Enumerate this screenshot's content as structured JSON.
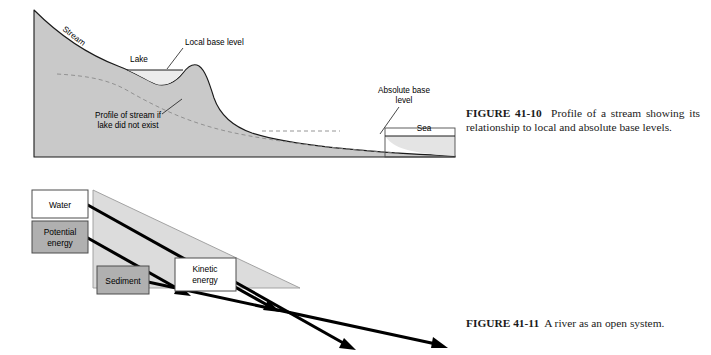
{
  "page": {
    "background": "#ffffff",
    "width": 711,
    "height": 355
  },
  "figures": [
    {
      "id": "figure-41-10",
      "number": "41-10",
      "caption_label": "FIGURE 41-10",
      "caption_text": "Profile of a stream showing its relationship to local and absolute base levels.",
      "labels": {
        "stream": "Stream",
        "lake": "Lake",
        "local_base_level": "Local base level",
        "absolute_base_level_line1": "Absolute base",
        "absolute_base_level_line2": "level",
        "sea": "Sea",
        "dashed_profile_line1": "Profile of stream if",
        "dashed_profile_line2": "lake did not exist"
      },
      "colors": {
        "land_fill": "#c9c9c9",
        "water_fill": "#e4e4e4",
        "outline": "#1a1a1a",
        "dashed_line": "#8a8a8a"
      }
    },
    {
      "id": "figure-41-11",
      "number": "41-11",
      "caption_label": "FIGURE 41-11",
      "caption_text": "A river as an open system.",
      "boxes": [
        {
          "name": "water",
          "label": "Water",
          "fill": "#ffffff",
          "lines": [
            "Water"
          ]
        },
        {
          "name": "potential-energy",
          "label": "Potential energy",
          "fill": "#b0b0b0",
          "lines": [
            "Potential",
            "energy"
          ]
        },
        {
          "name": "sediment",
          "label": "Sediment",
          "fill": "#b0b0b0",
          "lines": [
            "Sediment"
          ]
        },
        {
          "name": "kinetic-energy",
          "label": "Kinetic energy",
          "fill": "#ffffff",
          "lines": [
            "Kinetic",
            "energy"
          ]
        }
      ],
      "colors": {
        "slope_fill": "#dcdcdc",
        "slope_outline": "#8a8a8a",
        "arrow": "#000000",
        "box_outline": "#4d4d4d"
      }
    }
  ]
}
